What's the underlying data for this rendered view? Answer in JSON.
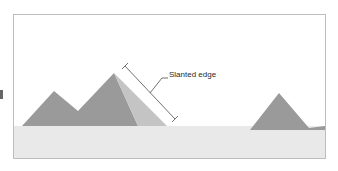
{
  "diagram": {
    "label": "Slanted edge",
    "colors": {
      "sky": "#ffffff",
      "ground": "#e9e9e9",
      "pyramid_dark": "#9a9a9a",
      "pyramid_light": "#c4c4c4",
      "line": "#4d4d4d",
      "border": "#bdbdbd"
    }
  }
}
